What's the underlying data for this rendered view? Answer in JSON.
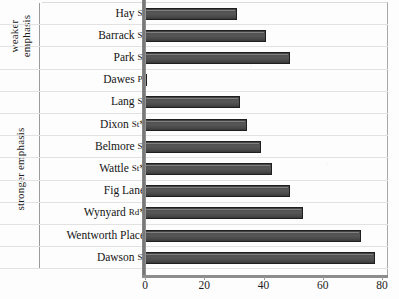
{
  "chart_data": {
    "type": "bar",
    "orientation": "horizontal",
    "title": "",
    "xlabel": "",
    "ylabel": "",
    "xlim": [
      0,
      80
    ],
    "xticks": [
      0,
      20,
      40,
      60,
      80
    ],
    "grid": false,
    "legend": "none",
    "categories": [
      "Hay St",
      "Barrack St",
      "Park St",
      "Dawes Pt",
      "Lang St",
      "Dixon St*",
      "Belmore St",
      "Wattle St*",
      "Fig Lane",
      "Wynyard Rd*",
      "Wentworth Place",
      "Dawson St"
    ],
    "values": [
      31,
      41,
      49,
      0.6,
      32,
      34.5,
      39,
      43,
      49,
      53.5,
      73,
      77.5
    ],
    "groups": [
      {
        "label_line1": "weaker",
        "label_line2": "emphasis",
        "start_index": 0,
        "count": 3
      },
      {
        "label_line1": "stronger emphasis",
        "label_line2": "",
        "start_index": 3,
        "count": 9
      }
    ],
    "bar_color": "#4a4a4a",
    "bar_border_color": "#1f1f1f",
    "axis_color": "#8d8d8d"
  },
  "rows": [
    {
      "label_main": "Hay",
      "label_suffix": "St",
      "label_star": "",
      "value": 31
    },
    {
      "label_main": "Barrack",
      "label_suffix": "St",
      "label_star": "",
      "value": 41
    },
    {
      "label_main": "Park",
      "label_suffix": "St",
      "label_star": "",
      "value": 49
    },
    {
      "label_main": "Dawes",
      "label_suffix": "Pt",
      "label_star": "",
      "value": 0.6
    },
    {
      "label_main": "Lang",
      "label_suffix": "St",
      "label_star": "",
      "value": 32
    },
    {
      "label_main": "Dixon",
      "label_suffix": "St",
      "label_star": "*",
      "value": 34.5
    },
    {
      "label_main": "Belmore",
      "label_suffix": "St",
      "label_star": "",
      "value": 39
    },
    {
      "label_main": "Wattle",
      "label_suffix": "St",
      "label_star": "*",
      "value": 43
    },
    {
      "label_main": "Fig Lane",
      "label_suffix": "",
      "label_star": "",
      "value": 49
    },
    {
      "label_main": "Wynyard",
      "label_suffix": "Rd",
      "label_star": "*",
      "value": 53.5
    },
    {
      "label_main": "Wentworth Place",
      "label_suffix": "",
      "label_star": "",
      "value": 73
    },
    {
      "label_main": "Dawson",
      "label_suffix": "St",
      "label_star": "",
      "value": 77.5
    }
  ],
  "axis": {
    "ticks": [
      "0",
      "20",
      "40",
      "60",
      "80"
    ]
  },
  "groups": {
    "weaker": {
      "line1": "weaker",
      "line2": "emphasis"
    },
    "stronger": {
      "line1": "stronger emphasis",
      "line2": ""
    }
  }
}
